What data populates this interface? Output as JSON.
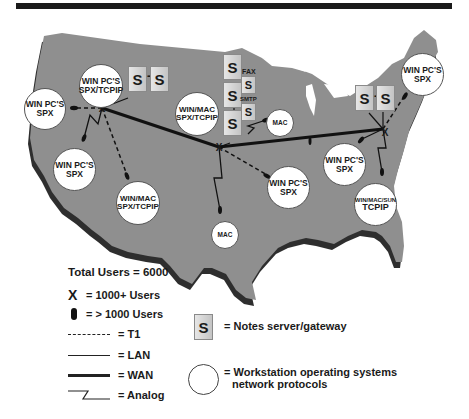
{
  "diagram": {
    "title_bar": "",
    "nodes": [
      {
        "id": "nw",
        "lines": [
          "WIN PC'S",
          "SPX/TCPIP"
        ]
      },
      {
        "id": "west",
        "lines": [
          "WIN PC'S",
          "SPX"
        ]
      },
      {
        "id": "sw1",
        "lines": [
          "WIN PC'S",
          "SPX"
        ]
      },
      {
        "id": "sw2",
        "lines": [
          "WIN/MAC",
          "SPX/TCPIP"
        ]
      },
      {
        "id": "central",
        "lines": [
          "WIN/MAC",
          "SPX/TCPIP"
        ]
      },
      {
        "id": "mac1",
        "lines": [
          "MAC"
        ]
      },
      {
        "id": "mac2",
        "lines": [
          "MAC"
        ]
      },
      {
        "id": "south",
        "lines": [
          "WIN PC'S",
          "SPX"
        ]
      },
      {
        "id": "ohio",
        "lines": [
          "WIN PC'S",
          "SPX"
        ]
      },
      {
        "id": "ne",
        "lines": [
          "WIN PC'S",
          "SPX"
        ]
      },
      {
        "id": "se",
        "lines": [
          "WIN/MAC/SUN",
          "TCPIP"
        ]
      }
    ],
    "servers": {
      "symbol": "S",
      "connector": "-",
      "fax_label": "FAX",
      "smtp_label": "SMTP"
    }
  },
  "legend": {
    "total_users": "Total Users = 6000",
    "x_symbol": "X",
    "x_label": "= 1000+ Users",
    "oval_label": "= > 1000 Users",
    "t1_label": "= T1",
    "lan_label": "= LAN",
    "wan_label": "= WAN",
    "analog_label": "= Analog",
    "server_symbol": "S",
    "server_label": "= Notes server/gateway",
    "workstation_label_1": "= Workstation operating systems",
    "workstation_label_2": "network protocols"
  },
  "colors": {
    "map_fill": "#8f8f8f",
    "map_shadow": "#2e2e2e",
    "node_fill": "#ffffff",
    "server_fill": "#d6d6d6",
    "text": "#1a1a1a"
  }
}
